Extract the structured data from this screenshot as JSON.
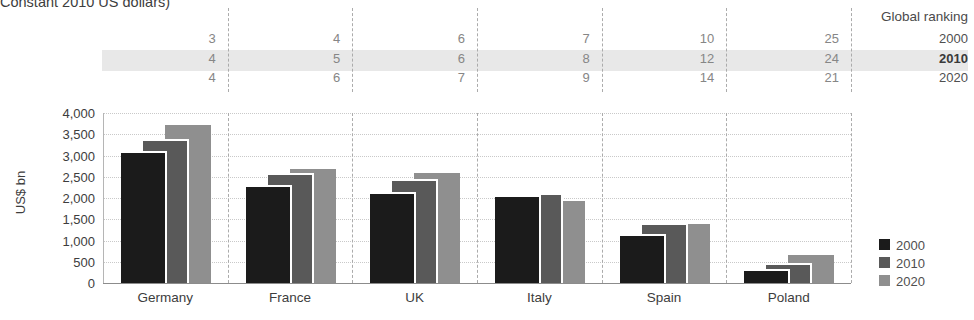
{
  "title": "Constant 2010 US dollars)",
  "ranking": {
    "header": "Global ranking",
    "rows": [
      {
        "year": "2000",
        "highlighted": false,
        "values": [
          "3",
          "4",
          "6",
          "7",
          "10",
          "25"
        ]
      },
      {
        "year": "2010",
        "highlighted": true,
        "values": [
          "4",
          "5",
          "6",
          "8",
          "12",
          "24"
        ]
      },
      {
        "year": "2020",
        "highlighted": false,
        "values": [
          "4",
          "6",
          "7",
          "9",
          "14",
          "21"
        ]
      }
    ]
  },
  "chart_data": {
    "type": "bar",
    "title": "Constant 2010 US dollars)",
    "ylabel": "US$ bn",
    "ylim": [
      0,
      4000
    ],
    "ytick_step": 500,
    "grid": true,
    "legend_position": "right",
    "categories": [
      "Germany",
      "France",
      "UK",
      "Italy",
      "Spain",
      "Poland"
    ],
    "series": [
      {
        "name": "2000",
        "color": "#1b1b1b",
        "values": [
          3100,
          2300,
          2150,
          2070,
          1150,
          330
        ]
      },
      {
        "name": "2010",
        "color": "#595959",
        "values": [
          3400,
          2600,
          2450,
          2120,
          1410,
          470
        ]
      },
      {
        "name": "2020",
        "color": "#8f8f8f",
        "values": [
          3720,
          2680,
          2600,
          1940,
          1390,
          650
        ]
      }
    ],
    "global_ranking": {
      "2000": [
        3,
        4,
        6,
        7,
        10,
        25
      ],
      "2010": [
        4,
        5,
        6,
        8,
        12,
        24
      ],
      "2020": [
        4,
        6,
        7,
        9,
        14,
        21
      ]
    }
  },
  "legend": [
    {
      "label": "2000",
      "color": "#1b1b1b"
    },
    {
      "label": "2010",
      "color": "#595959"
    },
    {
      "label": "2020",
      "color": "#8f8f8f"
    }
  ],
  "colors": {
    "highlight_band": "#e8e8e8",
    "ranking_number": "#868686",
    "year_label": "#4f4f4f",
    "axis_text": "#3d3d3d"
  }
}
